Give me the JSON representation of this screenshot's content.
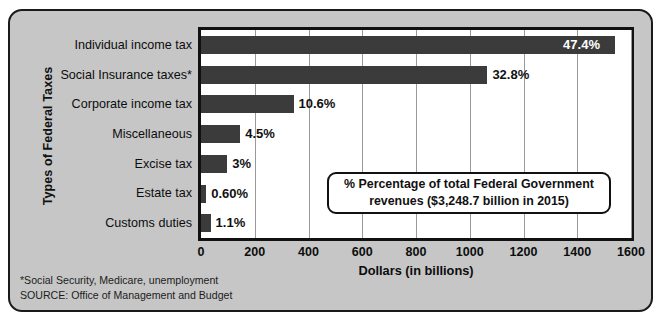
{
  "chart_data": {
    "type": "bar",
    "orientation": "horizontal",
    "title": "",
    "xlabel": "Dollars (in billions)",
    "ylabel": "Types of Federal Taxes",
    "xlim": [
      0,
      1600
    ],
    "xticks": [
      0,
      200,
      400,
      600,
      800,
      1000,
      1200,
      1400,
      1600
    ],
    "grid": true,
    "legend_position": "inside-lower-right",
    "categories": [
      "Individual income tax",
      "Social Insurance taxes*",
      "Corporate income tax",
      "Miscellaneous",
      "Excise tax",
      "Estate tax",
      "Customs duties"
    ],
    "values": [
      1540.9,
      1065.6,
      344.4,
      146.2,
      97.5,
      19.5,
      35.7
    ],
    "percent_labels": [
      "47.4%",
      "32.8%",
      "10.6%",
      "4.5%",
      "3%",
      "0.60%",
      "1.1%"
    ],
    "percent_values": [
      47.4,
      32.8,
      10.6,
      4.5,
      3.0,
      0.6,
      1.1
    ],
    "label_placement": [
      "inside",
      "outside",
      "outside",
      "outside",
      "outside",
      "outside",
      "outside"
    ],
    "bar_color": "#3b3b3b",
    "plot_background": "#ffffff",
    "panel_background": "#c6c6c6",
    "annotations": [
      "% Percentage of total Federal Government",
      "revenues ($3,248.7 billion in 2015)"
    ],
    "footnotes": [
      "*Social Security, Medicare, unemployment",
      "SOURCE: Office of Management and Budget"
    ]
  },
  "axis": {
    "y_title": "Types of Federal Taxes",
    "x_title": "Dollars (in billions)",
    "ticks": [
      "0",
      "200",
      "400",
      "600",
      "800",
      "1000",
      "1200",
      "1400",
      "1600"
    ]
  },
  "legend": {
    "line1": "% Percentage of total Federal Government",
    "line2": "revenues ($3,248.7 billion in 2015)"
  },
  "footnotes": {
    "note": "*Social Security, Medicare, unemployment",
    "source": "SOURCE: Office of Management and Budget"
  }
}
